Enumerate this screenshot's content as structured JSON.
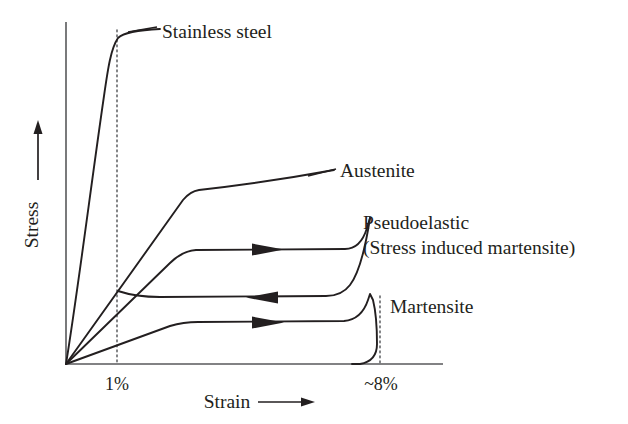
{
  "figure": {
    "background": "#ffffff",
    "ink_color": "#231f20",
    "axis_color": "#58595b",
    "guide_color": "#6d6e71"
  },
  "axes": {
    "y_title": "Stress",
    "y_title_arrow": "up-arrow",
    "x_title": "Strain",
    "x_title_arrow": "right-arrow",
    "origin": {
      "x": 66,
      "y": 364
    },
    "x_axis_end": {
      "x": 443,
      "y": 364
    },
    "y_axis_top": {
      "x": 66,
      "y": 22
    }
  },
  "ticks": [
    {
      "label": "1%",
      "x_px": 117,
      "guide_top_y": 30,
      "guide_bottom_y": 364
    },
    {
      "label": "~8%",
      "x_px": 380,
      "guide_top_y": 296,
      "guide_bottom_y": 364
    }
  ],
  "annotations": [
    {
      "name": "stainless-steel",
      "text": "Stainless steel",
      "x": 160,
      "y": 40
    },
    {
      "name": "austenite",
      "text": "Austenite",
      "x": 340,
      "y": 175
    },
    {
      "name": "pseudoelastic",
      "text": "Pseudoelastic",
      "x": 363,
      "y": 228
    },
    {
      "name": "stress-induced-martensite",
      "text": "(Stress induced martensite)",
      "x": 363,
      "y": 253
    },
    {
      "name": "martensite",
      "text": "Martensite",
      "x": 388,
      "y": 311
    }
  ],
  "chart_data": {
    "type": "line",
    "title": "",
    "xlabel": "Strain",
    "ylabel": "Stress",
    "xlim": [
      0,
      10
    ],
    "ylim": [
      0,
      1
    ],
    "grid": false,
    "legend": "annotated-inline",
    "xticks": [
      "1%",
      "~8%"
    ],
    "yticks": [],
    "series": [
      {
        "name": "Stainless steel",
        "description": "Steep linear elastic rise to a yield knee near 1% strain, then a nearly flat work-hardening plateau.",
        "points_px": [
          [
            66,
            364
          ],
          [
            80,
            260
          ],
          [
            95,
            150
          ],
          [
            104,
            95
          ],
          [
            110,
            60
          ],
          [
            117,
            38
          ],
          [
            126,
            33
          ],
          [
            145,
            30
          ],
          [
            160,
            29
          ]
        ]
      },
      {
        "name": "Austenite",
        "description": "Moderate linear elastic slope to a knee, then a gently rising plateau toward the label.",
        "points_px": [
          [
            66,
            364
          ],
          [
            120,
            287
          ],
          [
            165,
            223
          ],
          [
            188,
            196
          ],
          [
            197,
            191
          ],
          [
            230,
            186
          ],
          [
            280,
            180
          ],
          [
            335,
            170
          ]
        ]
      },
      {
        "name": "Pseudoelastic loading (upper plateau)",
        "description": "Loading branch of the superelastic hysteresis: elastic rise, upper stress plateau with rightward arrow, then steep stress rise at the end of the plateau.",
        "points_px": [
          [
            66,
            364
          ],
          [
            110,
            320
          ],
          [
            150,
            282
          ],
          [
            175,
            259
          ],
          [
            190,
            251
          ],
          [
            210,
            249
          ],
          [
            260,
            249
          ],
          [
            310,
            249
          ],
          [
            345,
            249
          ],
          [
            356,
            246
          ],
          [
            364,
            236
          ],
          [
            370,
            222
          ]
        ],
        "arrow": {
          "direction": "right",
          "x": 268,
          "y": 249
        }
      },
      {
        "name": "Pseudoelastic unloading (lower plateau)",
        "description": "Unloading branch of the superelastic hysteresis: descends from the top of the loading branch then runs back leftward along a lower stress plateau with leftward arrow.",
        "points_px": [
          [
            370,
            222
          ],
          [
            363,
            247
          ],
          [
            352,
            276
          ],
          [
            342,
            290
          ],
          [
            330,
            295
          ],
          [
            300,
            297
          ],
          [
            250,
            297
          ],
          [
            200,
            297
          ],
          [
            170,
            297
          ],
          [
            150,
            296
          ],
          [
            120,
            292
          ]
        ],
        "arrow": {
          "direction": "left",
          "x": 262,
          "y": 297
        }
      },
      {
        "name": "Martensite",
        "description": "Low-slope elastic rise, long flat detwinning plateau with rightward arrow, then a steep rise at ~8% strain and a near-vertical unload back toward the strain axis.",
        "points_px": [
          [
            66,
            364
          ],
          [
            120,
            340
          ],
          [
            160,
            328
          ],
          [
            190,
            323
          ],
          [
            230,
            322
          ],
          [
            280,
            322
          ],
          [
            330,
            321
          ],
          [
            352,
            318
          ],
          [
            363,
            308
          ],
          [
            370,
            298
          ],
          [
            374,
            301
          ],
          [
            376,
            318
          ],
          [
            377,
            340
          ],
          [
            376,
            356
          ],
          [
            370,
            362
          ],
          [
            355,
            364
          ]
        ],
        "arrow": {
          "direction": "right",
          "x": 268,
          "y": 322
        }
      }
    ],
    "notes": [
      "Schematic stress-strain curves comparing stainless steel with shape-memory alloy (NiTi) behaviour.",
      "Dotted vertical guides mark 1% strain and ~8% strain.",
      "Arrows indicate loading (right) and unloading (left) directions."
    ]
  }
}
